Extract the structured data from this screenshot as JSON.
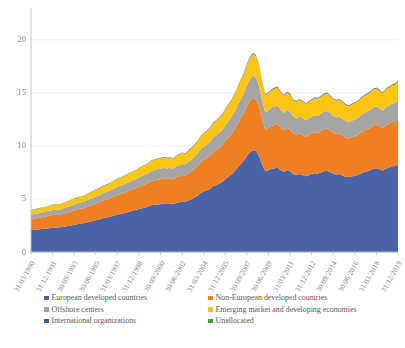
{
  "chart_data": {
    "type": "area",
    "title": "",
    "subtitle": "",
    "xlabel": "",
    "ylabel": "",
    "stacked": true,
    "grid": true,
    "legend_position": "bottom",
    "ylim": [
      0,
      23
    ],
    "yticks": [
      0,
      5,
      10,
      15,
      20
    ],
    "ytick_labels": [
      "0",
      "5",
      "10",
      "15",
      "20"
    ],
    "xtick_labels": [
      "31/03/1990",
      "31/12/1991",
      "30/09/1993",
      "30/06/1995",
      "31/03/1997",
      "31/12/1998",
      "30/09/2000",
      "30/06/2002",
      "31/03/2004",
      "31/12/2005",
      "30/09/2007",
      "30/06/2009",
      "31/03/2011",
      "31/12/2012",
      "30/09/2014",
      "30/06/2016",
      "31/03/2018",
      "31/12/2019"
    ],
    "x": [
      "1990Q1",
      "1990Q2",
      "1990Q3",
      "1990Q4",
      "1991Q1",
      "1991Q2",
      "1991Q3",
      "1991Q4",
      "1992Q1",
      "1992Q2",
      "1992Q3",
      "1992Q4",
      "1993Q1",
      "1993Q2",
      "1993Q3",
      "1993Q4",
      "1994Q1",
      "1994Q2",
      "1994Q3",
      "1994Q4",
      "1995Q1",
      "1995Q2",
      "1995Q3",
      "1995Q4",
      "1996Q1",
      "1996Q2",
      "1996Q3",
      "1996Q4",
      "1997Q1",
      "1997Q2",
      "1997Q3",
      "1997Q4",
      "1998Q1",
      "1998Q2",
      "1998Q3",
      "1998Q4",
      "1999Q1",
      "1999Q2",
      "1999Q3",
      "1999Q4",
      "2000Q1",
      "2000Q2",
      "2000Q3",
      "2000Q4",
      "2001Q1",
      "2001Q2",
      "2001Q3",
      "2001Q4",
      "2002Q1",
      "2002Q2",
      "2002Q3",
      "2002Q4",
      "2003Q1",
      "2003Q2",
      "2003Q3",
      "2003Q4",
      "2004Q1",
      "2004Q2",
      "2004Q3",
      "2004Q4",
      "2005Q1",
      "2005Q2",
      "2005Q3",
      "2005Q4",
      "2006Q1",
      "2006Q2",
      "2006Q3",
      "2006Q4",
      "2007Q1",
      "2007Q2",
      "2007Q3",
      "2007Q4",
      "2008Q1",
      "2008Q2",
      "2008Q3",
      "2008Q4",
      "2009Q1",
      "2009Q2",
      "2009Q3",
      "2009Q4",
      "2010Q1",
      "2010Q2",
      "2010Q3",
      "2010Q4",
      "2011Q1",
      "2011Q2",
      "2011Q3",
      "2011Q4",
      "2012Q1",
      "2012Q2",
      "2012Q3",
      "2012Q4",
      "2013Q1",
      "2013Q2",
      "2013Q3",
      "2013Q4",
      "2014Q1",
      "2014Q2",
      "2014Q3",
      "2014Q4",
      "2015Q1",
      "2015Q2",
      "2015Q3",
      "2015Q4",
      "2016Q1",
      "2016Q2",
      "2016Q3",
      "2016Q4",
      "2017Q1",
      "2017Q2",
      "2017Q3",
      "2017Q4",
      "2018Q1",
      "2018Q2",
      "2018Q3",
      "2018Q4",
      "2019Q1",
      "2019Q2",
      "2019Q3",
      "2019Q4"
    ],
    "series": [
      {
        "name": "European developed countries",
        "color": "#4a62a8",
        "values": [
          2.05,
          2.1,
          2.12,
          2.15,
          2.18,
          2.22,
          2.25,
          2.3,
          2.32,
          2.3,
          2.35,
          2.4,
          2.45,
          2.5,
          2.58,
          2.62,
          2.68,
          2.7,
          2.78,
          2.85,
          2.92,
          3.0,
          3.05,
          3.15,
          3.22,
          3.28,
          3.35,
          3.45,
          3.52,
          3.58,
          3.66,
          3.72,
          3.82,
          3.9,
          3.95,
          4.05,
          4.12,
          4.2,
          4.28,
          4.4,
          4.45,
          4.48,
          4.5,
          4.55,
          4.52,
          4.55,
          4.5,
          4.62,
          4.68,
          4.75,
          4.72,
          4.85,
          4.98,
          5.15,
          5.3,
          5.55,
          5.7,
          5.8,
          5.95,
          6.2,
          6.3,
          6.45,
          6.6,
          6.85,
          7.1,
          7.3,
          7.6,
          7.95,
          8.3,
          8.6,
          9.05,
          9.4,
          9.6,
          9.5,
          9.0,
          8.2,
          7.6,
          7.7,
          7.85,
          7.9,
          7.95,
          7.7,
          7.55,
          7.7,
          7.6,
          7.35,
          7.25,
          7.35,
          7.28,
          7.15,
          7.22,
          7.35,
          7.42,
          7.4,
          7.5,
          7.62,
          7.65,
          7.55,
          7.38,
          7.3,
          7.35,
          7.22,
          7.1,
          7.05,
          7.12,
          7.18,
          7.25,
          7.4,
          7.55,
          7.62,
          7.7,
          7.85,
          7.9,
          7.8,
          7.65,
          7.85,
          7.95,
          8.05,
          8.1,
          8.25
        ]
      },
      {
        "name": "Non-European developed countries",
        "color": "#ee8023",
        "values": [
          1.05,
          1.06,
          1.08,
          1.1,
          1.12,
          1.14,
          1.16,
          1.18,
          1.2,
          1.18,
          1.22,
          1.25,
          1.28,
          1.32,
          1.35,
          1.38,
          1.4,
          1.42,
          1.46,
          1.5,
          1.54,
          1.58,
          1.6,
          1.65,
          1.68,
          1.72,
          1.75,
          1.8,
          1.84,
          1.88,
          1.9,
          1.94,
          1.98,
          2.02,
          2.05,
          2.1,
          2.14,
          2.18,
          2.22,
          2.28,
          2.32,
          2.34,
          2.36,
          2.38,
          2.36,
          2.38,
          2.34,
          2.42,
          2.46,
          2.5,
          2.48,
          2.56,
          2.62,
          2.7,
          2.78,
          2.9,
          2.98,
          3.04,
          3.12,
          3.24,
          3.3,
          3.38,
          3.46,
          3.58,
          3.7,
          3.82,
          3.96,
          4.14,
          4.3,
          4.46,
          4.68,
          4.86,
          4.95,
          4.88,
          4.62,
          4.22,
          3.92,
          3.98,
          4.06,
          4.1,
          4.12,
          4.0,
          3.92,
          4.0,
          3.95,
          3.82,
          3.76,
          3.82,
          3.78,
          3.72,
          3.76,
          3.82,
          3.86,
          3.84,
          3.9,
          3.96,
          3.98,
          3.92,
          3.84,
          3.8,
          3.82,
          3.76,
          3.7,
          3.66,
          3.7,
          3.74,
          3.78,
          3.86,
          3.92,
          3.96,
          4.0,
          4.08,
          4.1,
          4.05,
          3.98,
          4.08,
          4.12,
          4.18,
          4.2,
          4.28
        ]
      },
      {
        "name": "Offshore centers",
        "color": "#a5a5a5",
        "values": [
          0.42,
          0.43,
          0.44,
          0.45,
          0.46,
          0.47,
          0.48,
          0.49,
          0.5,
          0.49,
          0.51,
          0.52,
          0.53,
          0.55,
          0.56,
          0.57,
          0.58,
          0.59,
          0.61,
          0.63,
          0.64,
          0.66,
          0.67,
          0.69,
          0.7,
          0.72,
          0.73,
          0.75,
          0.77,
          0.78,
          0.8,
          0.81,
          0.83,
          0.85,
          0.86,
          0.88,
          0.9,
          0.92,
          0.93,
          0.96,
          0.97,
          0.98,
          0.99,
          1.0,
          0.99,
          1.0,
          0.98,
          1.01,
          1.03,
          1.05,
          1.04,
          1.07,
          1.1,
          1.13,
          1.17,
          1.22,
          1.25,
          1.27,
          1.31,
          1.36,
          1.38,
          1.42,
          1.45,
          1.5,
          1.55,
          1.6,
          1.66,
          1.74,
          1.8,
          1.87,
          1.96,
          2.04,
          2.08,
          2.05,
          1.94,
          1.77,
          1.64,
          1.67,
          1.7,
          1.72,
          1.73,
          1.68,
          1.64,
          1.68,
          1.66,
          1.6,
          1.58,
          1.6,
          1.58,
          1.56,
          1.58,
          1.6,
          1.62,
          1.61,
          1.63,
          1.66,
          1.67,
          1.64,
          1.61,
          1.59,
          1.6,
          1.58,
          1.55,
          1.53,
          1.55,
          1.57,
          1.58,
          1.62,
          1.64,
          1.66,
          1.68,
          1.71,
          1.72,
          1.7,
          1.67,
          1.71,
          1.73,
          1.75,
          1.76,
          1.79
        ]
      },
      {
        "name": "Emerging market and developing economies",
        "color": "#fdc513",
        "values": [
          0.4,
          0.41,
          0.42,
          0.43,
          0.44,
          0.45,
          0.46,
          0.47,
          0.48,
          0.47,
          0.49,
          0.5,
          0.51,
          0.53,
          0.54,
          0.55,
          0.56,
          0.57,
          0.59,
          0.61,
          0.62,
          0.64,
          0.65,
          0.67,
          0.68,
          0.7,
          0.71,
          0.73,
          0.75,
          0.76,
          0.78,
          0.79,
          0.81,
          0.83,
          0.84,
          0.86,
          0.88,
          0.9,
          0.91,
          0.94,
          0.95,
          0.96,
          0.97,
          0.98,
          0.97,
          0.98,
          0.96,
          0.99,
          1.01,
          1.03,
          1.02,
          1.05,
          1.08,
          1.11,
          1.15,
          1.2,
          1.23,
          1.25,
          1.29,
          1.34,
          1.36,
          1.4,
          1.43,
          1.48,
          1.53,
          1.58,
          1.64,
          1.72,
          1.78,
          1.85,
          1.94,
          2.02,
          2.06,
          2.03,
          1.92,
          1.75,
          1.62,
          1.65,
          1.68,
          1.7,
          1.71,
          1.66,
          1.62,
          1.66,
          1.64,
          1.58,
          1.56,
          1.58,
          1.56,
          1.54,
          1.56,
          1.58,
          1.6,
          1.59,
          1.61,
          1.64,
          1.65,
          1.62,
          1.59,
          1.57,
          1.58,
          1.56,
          1.53,
          1.51,
          1.53,
          1.55,
          1.56,
          1.6,
          1.62,
          1.64,
          1.66,
          1.69,
          1.7,
          1.68,
          1.65,
          1.69,
          1.71,
          1.73,
          1.74,
          1.77
        ]
      },
      {
        "name": "International organizations",
        "color": "#3a5ca8",
        "values": [
          0.02,
          0.02,
          0.02,
          0.02,
          0.02,
          0.02,
          0.02,
          0.02,
          0.02,
          0.02,
          0.02,
          0.02,
          0.02,
          0.02,
          0.02,
          0.02,
          0.02,
          0.02,
          0.02,
          0.02,
          0.03,
          0.03,
          0.03,
          0.03,
          0.03,
          0.03,
          0.03,
          0.03,
          0.03,
          0.03,
          0.03,
          0.03,
          0.03,
          0.03,
          0.03,
          0.03,
          0.03,
          0.03,
          0.03,
          0.04,
          0.04,
          0.04,
          0.04,
          0.04,
          0.04,
          0.04,
          0.04,
          0.04,
          0.04,
          0.04,
          0.04,
          0.04,
          0.04,
          0.05,
          0.05,
          0.05,
          0.05,
          0.05,
          0.05,
          0.05,
          0.05,
          0.05,
          0.05,
          0.06,
          0.06,
          0.06,
          0.06,
          0.06,
          0.06,
          0.07,
          0.07,
          0.07,
          0.07,
          0.07,
          0.07,
          0.06,
          0.06,
          0.06,
          0.06,
          0.06,
          0.06,
          0.06,
          0.06,
          0.06,
          0.06,
          0.06,
          0.06,
          0.06,
          0.06,
          0.06,
          0.06,
          0.06,
          0.06,
          0.06,
          0.06,
          0.06,
          0.06,
          0.06,
          0.06,
          0.06,
          0.06,
          0.06,
          0.06,
          0.06,
          0.06,
          0.06,
          0.06,
          0.06,
          0.06,
          0.06,
          0.06,
          0.07,
          0.07,
          0.07,
          0.07,
          0.07,
          0.07,
          0.07,
          0.07,
          0.07
        ]
      },
      {
        "name": "Unallocated",
        "color": "#4f9a45",
        "values": [
          0.01,
          0.01,
          0.01,
          0.01,
          0.01,
          0.01,
          0.01,
          0.01,
          0.01,
          0.01,
          0.01,
          0.01,
          0.01,
          0.01,
          0.01,
          0.01,
          0.01,
          0.01,
          0.01,
          0.01,
          0.01,
          0.01,
          0.01,
          0.01,
          0.01,
          0.01,
          0.01,
          0.01,
          0.01,
          0.01,
          0.01,
          0.01,
          0.01,
          0.01,
          0.01,
          0.01,
          0.01,
          0.01,
          0.01,
          0.01,
          0.01,
          0.01,
          0.01,
          0.01,
          0.01,
          0.01,
          0.01,
          0.01,
          0.01,
          0.01,
          0.01,
          0.01,
          0.01,
          0.01,
          0.01,
          0.01,
          0.01,
          0.01,
          0.02,
          0.02,
          0.02,
          0.02,
          0.02,
          0.02,
          0.02,
          0.02,
          0.02,
          0.02,
          0.02,
          0.02,
          0.02,
          0.02,
          0.02,
          0.02,
          0.02,
          0.02,
          0.02,
          0.02,
          0.02,
          0.02,
          0.02,
          0.02,
          0.02,
          0.02,
          0.02,
          0.02,
          0.02,
          0.02,
          0.02,
          0.02,
          0.02,
          0.02,
          0.02,
          0.02,
          0.02,
          0.02,
          0.02,
          0.02,
          0.02,
          0.02,
          0.02,
          0.02,
          0.02,
          0.02,
          0.02,
          0.02,
          0.02,
          0.02,
          0.02,
          0.02,
          0.02,
          0.02,
          0.02,
          0.02,
          0.02,
          0.02,
          0.02,
          0.02,
          0.02,
          0.02
        ]
      }
    ],
    "peak": {
      "label": "30/09/2007",
      "value": 22.5
    }
  },
  "legend": {
    "items": [
      {
        "label": "European developed countries",
        "color": "#4a62a8"
      },
      {
        "label": "Non-European developed countries",
        "color": "#ee8023"
      },
      {
        "label": "Offshore centers",
        "color": "#a5a5a5"
      },
      {
        "label": "Emerging market and developing economies",
        "color": "#fdc513"
      },
      {
        "label": "International organizations",
        "color": "#3a5ca8"
      },
      {
        "label": "Unallocated",
        "color": "#4f9a45"
      }
    ]
  },
  "style": {
    "gridline_color": "#e8e8e8",
    "axis_color": "#bfbfbf",
    "tick_text_color": "#7f7f7f",
    "legend_text_color": "#595959",
    "background": "#ffffff"
  }
}
